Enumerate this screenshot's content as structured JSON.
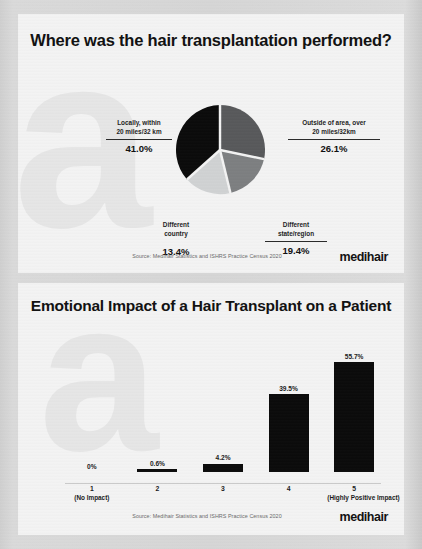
{
  "brand": {
    "logo_text": "medihair",
    "accent_dark": "#0b0b0b",
    "mid_gray": "#58595b",
    "light_gray": "#d0d2d3",
    "panel_bg": "#f3f3f3",
    "watermark_letter": "a"
  },
  "panels": {
    "pie_panel": {
      "title": "Where was the hair transplantation performed?",
      "source": "Source: Medihair Statistics and ISHRS Practice Census 2020",
      "callouts": [
        {
          "id": "locally",
          "label": "Locally, within\n20 miles/32 km",
          "value": "41.0%"
        },
        {
          "id": "outside",
          "label": "Outside of area, over\n20 miles/32km",
          "value": "26.1%"
        },
        {
          "id": "country",
          "label": "Different\ncountry",
          "value": "13.4%"
        },
        {
          "id": "state",
          "label": "Different\nstate/region",
          "value": "19.4%"
        }
      ]
    },
    "bar_panel": {
      "title": "Emotional Impact of a Hair Transplant on a Patient",
      "source": "Source: Medihair Statistics and ISHRS Practice Census 2020"
    }
  },
  "chart_data": [
    {
      "type": "pie",
      "title": "Where was the hair transplantation performed?",
      "labels": [
        "Locally, within 20 miles/32 km",
        "Outside of area, over 20 miles/32km",
        "Different state/region",
        "Different country"
      ],
      "values": [
        41.0,
        26.1,
        19.4,
        13.4
      ],
      "value_labels": [
        "41.0%",
        "26.1%",
        "19.4%",
        "13.4%"
      ],
      "colors": [
        "#0b0b0b",
        "#58595b",
        "#7d7f81",
        "#d0d2d3"
      ],
      "legend": "callout-labels",
      "annotations": [
        "Source: Medihair Statistics and ISHRS Practice Census 2020"
      ]
    },
    {
      "type": "bar",
      "title": "Emotional Impact of a Hair Transplant on a Patient",
      "categories": [
        "1",
        "2",
        "3",
        "4",
        "5"
      ],
      "category_sublabels": [
        "(No Impact)",
        "",
        "",
        "",
        "(Highly Positive Impact)"
      ],
      "values": [
        0,
        0.6,
        4.2,
        39.5,
        55.7
      ],
      "value_labels": [
        "0%",
        "0.6%",
        "4.2%",
        "39.5%",
        "55.7%"
      ],
      "xlabel": "",
      "ylabel": "",
      "ylim": [
        0,
        60
      ],
      "grid": false,
      "bar_color": "#0b0b0b",
      "annotations": [
        "Source: Medihair Statistics and ISHRS Practice Census 2020"
      ]
    }
  ]
}
